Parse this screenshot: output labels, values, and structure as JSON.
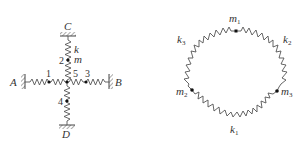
{
  "figure_left": {
    "walls": {
      "top": "C",
      "bottom": "D",
      "left": "A",
      "right": "B"
    },
    "spring_label": "k",
    "mass_label": "m",
    "masses": [
      "1",
      "2",
      "3",
      "4",
      "5"
    ]
  },
  "figure_right": {
    "springs": [
      {
        "name": "k",
        "sub": "1"
      },
      {
        "name": "k",
        "sub": "2"
      },
      {
        "name": "k",
        "sub": "3"
      }
    ],
    "masses": [
      {
        "name": "m",
        "sub": "1"
      },
      {
        "name": "m",
        "sub": "2"
      },
      {
        "name": "m",
        "sub": "3"
      }
    ]
  }
}
